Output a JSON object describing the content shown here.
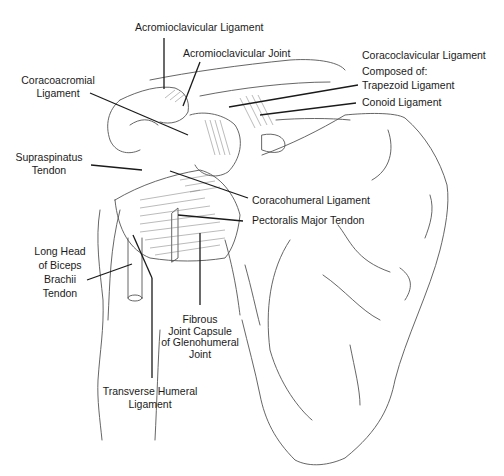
{
  "figure": {
    "labels": {
      "acromioclavicular_ligament": "Acromioclavicular Ligament",
      "acromioclavicular_joint": "Acromioclavicular Joint",
      "coracoclavicular_ligament": "Coracoclavicular Ligament",
      "composed_of": "Composed of:",
      "trapezoid_ligament": "Trapezoid Ligament",
      "conoid_ligament": "Conoid Ligament",
      "coracoacromial_ligament_1": "Coracoacromial",
      "coracoacromial_ligament_2": "Ligament",
      "supraspinatus_tendon_1": "Supraspinatus",
      "supraspinatus_tendon_2": "Tendon",
      "coracohumeral_ligament": "Coracohumeral Ligament",
      "pectoralis_major_tendon": "Pectoralis Major Tendon",
      "biceps_1": "Long Head",
      "biceps_2": "of Biceps",
      "biceps_3": "Brachii",
      "biceps_4": "Tendon",
      "capsule_1": "Fibrous",
      "capsule_2": "Joint Capsule",
      "capsule_3": "of Glenohumeral",
      "capsule_4": "Joint",
      "transverse_humeral_1": "Transverse Humeral",
      "transverse_humeral_2": "Ligament"
    },
    "colors": {
      "line": "#1a1a1a",
      "sketch": "#555555",
      "background": "#ffffff"
    }
  }
}
